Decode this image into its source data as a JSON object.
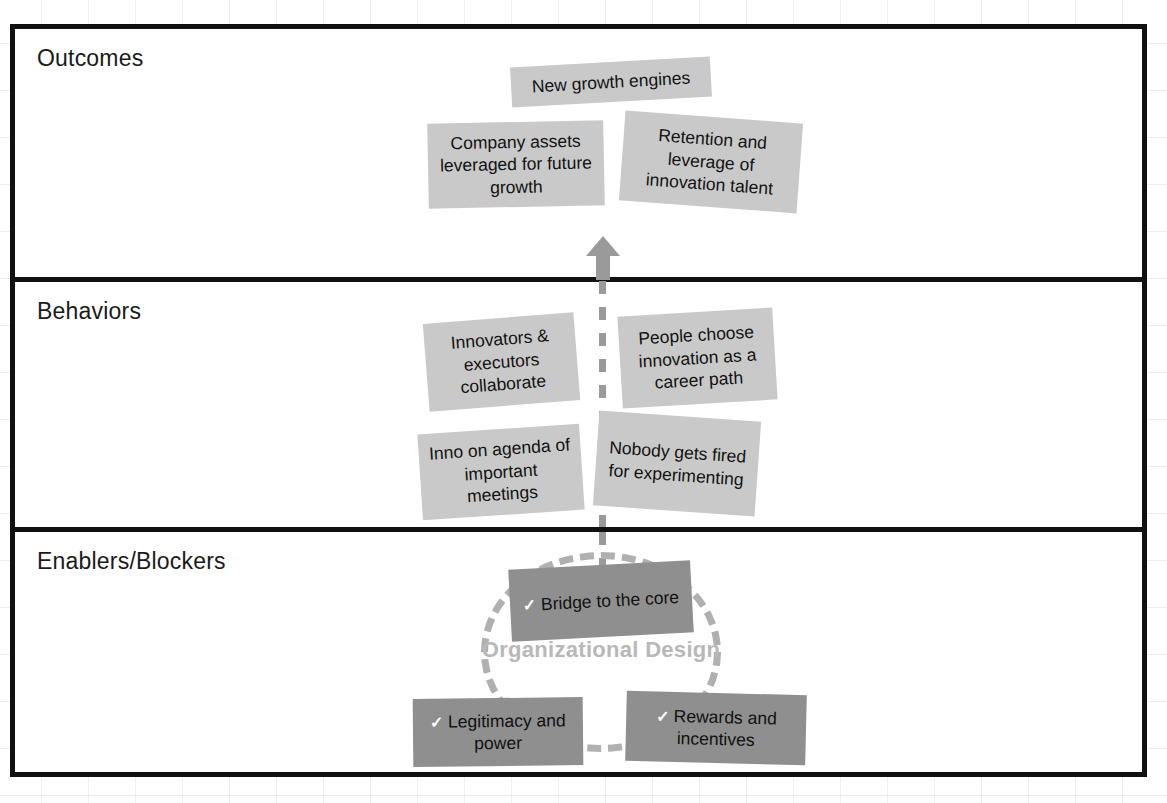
{
  "diagram": {
    "bands": [
      {
        "id": "outcomes",
        "label": "Outcomes"
      },
      {
        "id": "behaviors",
        "label": "Behaviors"
      },
      {
        "id": "enablers",
        "label": "Enablers/Blockers"
      }
    ],
    "outcomes_cards": [
      {
        "text": "New growth engines"
      },
      {
        "text": "Company assets leveraged for future growth"
      },
      {
        "text": "Retention and leverage of innovation talent"
      }
    ],
    "behaviors_cards": [
      {
        "text": "Innovators & executors collaborate"
      },
      {
        "text": "People choose innovation as a career path"
      },
      {
        "text": "Inno on agenda of important meetings"
      },
      {
        "text": "Nobody gets fired for experimenting"
      }
    ],
    "enablers": {
      "circle_label": "Organizational Design",
      "check_glyph": "✓",
      "cards": [
        {
          "text": "Bridge to the core",
          "checked": true
        },
        {
          "text": "Legitimacy and power",
          "checked": true
        },
        {
          "text": "Rewards and incentives",
          "checked": true
        }
      ]
    },
    "colors": {
      "frame": "#111111",
      "card_light": "#c9c9c9",
      "card_dark": "#8f8f8f",
      "connector": "#9a9a9a",
      "circle_label": "#b8b8b8",
      "text": "#121212"
    }
  }
}
